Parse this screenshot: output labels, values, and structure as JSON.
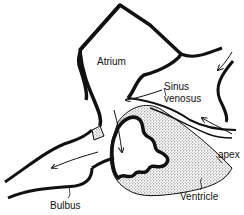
{
  "diagram": {
    "labels": {
      "atrium": "Atrium",
      "sinus_line1": "Sinus",
      "sinus_line2": "venosus",
      "apex": "apex",
      "ventricle": "Ventricle",
      "bulbus": "Bulbus"
    },
    "colors": {
      "ink": "#111111",
      "background": "#ffffff",
      "stipple": "#9a9a9a"
    }
  }
}
